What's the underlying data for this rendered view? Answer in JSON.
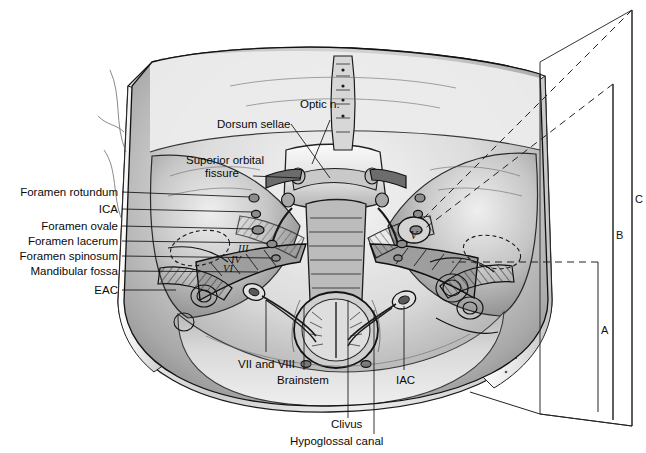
{
  "figure": {
    "type": "medical-line-drawing",
    "background_color": "#ffffff",
    "ink_color": "#111111",
    "tone_light": "#e8e8e8",
    "tone_mid": "#b4b4b4",
    "tone_dark": "#6e6e6e",
    "tone_darkest": "#2a2a2a"
  },
  "labels_left": [
    {
      "id": "foramen-rotundum",
      "text": "Foramen rotundum",
      "x": 118,
      "y": 192,
      "leader_to_x": 250,
      "leader_to_y": 196
    },
    {
      "id": "ica",
      "text": "ICA",
      "x": 118,
      "y": 209,
      "leader_to_x": 250,
      "leader_to_y": 212
    },
    {
      "id": "foramen-ovale",
      "text": "Foramen ovale",
      "x": 118,
      "y": 226,
      "leader_to_x": 252,
      "leader_to_y": 228
    },
    {
      "id": "foramen-lacerum",
      "text": "Foramen lacerum",
      "x": 118,
      "y": 241,
      "leader_to_x": 268,
      "leader_to_y": 243
    },
    {
      "id": "foramen-spinosum",
      "text": "Foramen spinosum",
      "x": 118,
      "y": 256,
      "leader_to_x": 272,
      "leader_to_y": 258
    },
    {
      "id": "mandibular-fossa",
      "text": "Mandibular fossa",
      "x": 118,
      "y": 271,
      "leader_to_x": 260,
      "leader_to_y": 272
    },
    {
      "id": "eac",
      "text": "EAC",
      "x": 118,
      "y": 290,
      "leader_to_x": 180,
      "leader_to_y": 290
    }
  ],
  "labels_upper": [
    {
      "id": "optic-nerve",
      "text": "Optic n.",
      "x": 300,
      "y": 104
    },
    {
      "id": "dorsum-sellae",
      "text": "Dorsum sellae",
      "x": 217,
      "y": 124
    },
    {
      "id": "superior-orbital-fissure-1",
      "text": "Superior orbital",
      "x": 186,
      "y": 160
    },
    {
      "id": "superior-orbital-fissure-2",
      "text": "fissure",
      "x": 205,
      "y": 173
    }
  ],
  "labels_lower": [
    {
      "id": "vii-and-viii",
      "text": "VII and VIII",
      "x": 243,
      "y": 365
    },
    {
      "id": "brainstem",
      "text": "Brainstem",
      "x": 282,
      "y": 380
    },
    {
      "id": "iac",
      "text": "IAC",
      "x": 398,
      "y": 380
    },
    {
      "id": "clivus",
      "text": "Clivus",
      "x": 333,
      "y": 424
    },
    {
      "id": "hypoglossal-canal",
      "text": "Hypoglossal canal",
      "x": 290,
      "y": 441
    }
  ],
  "cranial_nerves": [
    {
      "id": "nerve-iii",
      "text": "III",
      "x": 240,
      "y": 248
    },
    {
      "id": "nerve-iv",
      "text": "IV",
      "x": 234,
      "y": 259
    },
    {
      "id": "nerve-vi",
      "text": "VI",
      "x": 226,
      "y": 268
    },
    {
      "id": "nerve-v",
      "text": "V",
      "x": 412,
      "y": 234
    }
  ],
  "brackets": [
    {
      "id": "bracket-a",
      "label": "A",
      "x": 598,
      "label_x": 602,
      "label_y": 330,
      "top_y": 262,
      "bottom_y": 412
    },
    {
      "id": "bracket-b",
      "label": "B",
      "x": 613,
      "label_x": 617,
      "label_y": 235,
      "top_y": 84,
      "bottom_y": 420
    },
    {
      "id": "bracket-c",
      "label": "C",
      "x": 632,
      "label_x": 630,
      "label_y": 199,
      "top_y": 10,
      "bottom_y": 426
    }
  ],
  "guide_lines": [
    {
      "id": "guide-c",
      "kind": "dashed",
      "x1": 632,
      "y1": 10,
      "x2": 420,
      "y2": 222
    },
    {
      "id": "guide-b",
      "kind": "dashed",
      "x1": 613,
      "y1": 84,
      "x2": 420,
      "y2": 232
    },
    {
      "id": "guide-a",
      "kind": "dashed",
      "x1": 598,
      "y1": 262,
      "x2": 452,
      "y2": 262
    }
  ]
}
